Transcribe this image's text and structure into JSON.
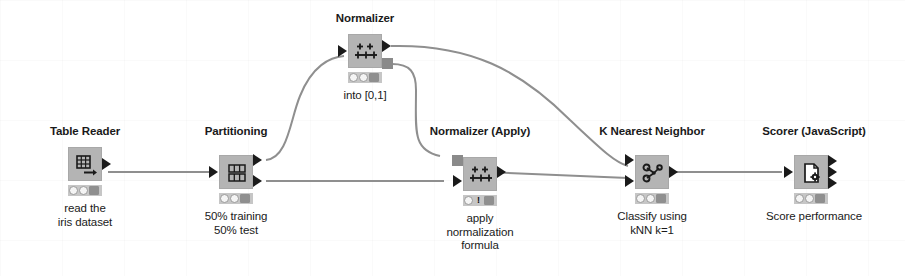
{
  "diagram": {
    "kind": "knime-workflow",
    "colors": {
      "node_body": "#b4b4b4",
      "edge": "#8f8f8f",
      "port": "#1a1a1a",
      "status_bar": "#c6c6c6",
      "background": "#ffffff"
    },
    "nodes": [
      {
        "id": "table-reader",
        "title": "Table Reader",
        "description": "read the\niris dataset",
        "icon": "table-grid-arrow-icon",
        "status": [
          "off",
          "off",
          "dark"
        ],
        "annotation": ""
      },
      {
        "id": "partitioning",
        "title": "Partitioning",
        "description": "50% training\n50% test",
        "icon": "partition-rows-icon",
        "status": [
          "off",
          "off",
          "dark"
        ],
        "annotation": ""
      },
      {
        "id": "normalizer",
        "title": "Normalizer",
        "description": "",
        "icon": "normalizer-axis-icon",
        "status": [
          "off",
          "off",
          "dark"
        ],
        "annotation": "into [0,1]"
      },
      {
        "id": "normalizer-apply",
        "title": "Normalizer (Apply)",
        "description": "apply\nnormalization\nformula",
        "icon": "normalizer-axis-icon",
        "status": [
          "off",
          "warning",
          "dark"
        ],
        "annotation": ""
      },
      {
        "id": "k-nearest-neighbor",
        "title": "K Nearest Neighbor",
        "description": "Classify using\nkNN k=1",
        "icon": "graph-nodes-icon",
        "status": [
          "off",
          "off",
          "dark"
        ],
        "annotation": ""
      },
      {
        "id": "scorer-javascript",
        "title": "Scorer (JavaScript)",
        "description": "Score performance",
        "icon": "document-gear-icon",
        "status": [
          "off",
          "off",
          "dark"
        ],
        "annotation": ""
      }
    ],
    "connections": [
      {
        "from": "table-reader",
        "to": "partitioning"
      },
      {
        "from": "partitioning",
        "to": "normalizer"
      },
      {
        "from": "partitioning",
        "to": "normalizer-apply"
      },
      {
        "from": "normalizer",
        "to": "k-nearest-neighbor"
      },
      {
        "from": "normalizer",
        "to": "normalizer-apply"
      },
      {
        "from": "normalizer-apply",
        "to": "k-nearest-neighbor"
      },
      {
        "from": "k-nearest-neighbor",
        "to": "scorer-javascript"
      }
    ]
  }
}
